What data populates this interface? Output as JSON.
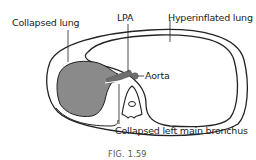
{
  "figure": {
    "caption": "FIG. 1.59",
    "labels": {
      "collapsed_lung": "Collapsed lung",
      "lpa": "LPA",
      "hyperinflated_lung": "Hyperinflated lung",
      "aorta": "Aorta",
      "collapsed_bronchus": "Collapsed left main bronchus"
    },
    "colors": {
      "outline": "#222222",
      "collapsed_lung_fill": "#8a8a8a",
      "vessel_fill": "#6e6e6e",
      "background": "#ffffff"
    }
  }
}
